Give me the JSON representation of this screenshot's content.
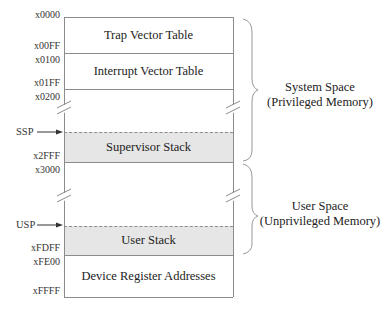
{
  "diagram": {
    "addresses": [
      {
        "label": "x0000",
        "y": 10
      },
      {
        "label": "x00FF",
        "y": 42
      },
      {
        "label": "x0100",
        "y": 55
      },
      {
        "label": "x01FF",
        "y": 78
      },
      {
        "label": "x0200",
        "y": 91
      },
      {
        "label": "x2FFF",
        "y": 151
      },
      {
        "label": "x3000",
        "y": 164
      },
      {
        "label": "xFDFF",
        "y": 244
      },
      {
        "label": "xFE00",
        "y": 257
      },
      {
        "label": "xFFFF",
        "y": 286
      }
    ],
    "regions": {
      "trap_vector_table": "Trap Vector Table",
      "interrupt_vector_table": "Interrupt Vector Table",
      "supervisor_stack": "Supervisor Stack",
      "user_stack": "User Stack",
      "device_register_addresses": "Device Register Addresses"
    },
    "pointers": {
      "ssp": "SSP",
      "usp": "USP"
    },
    "spaces": {
      "system": {
        "line1": "System Space",
        "line2": "(Privileged Memory)"
      },
      "user": {
        "line1": "User Space",
        "line2": "(Unprivileged Memory)"
      }
    },
    "colors": {
      "stack_fill": "#e6e6e6",
      "line": "#8c8c8c"
    }
  }
}
